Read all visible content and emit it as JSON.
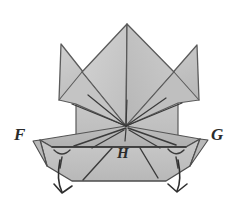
{
  "figure": {
    "kind": "origami-fold-diagram",
    "background_color": "#ffffff",
    "paper_fill_light": "#cfcfcf",
    "paper_fill_mid": "#c2c2c2",
    "paper_fill_dark": "#b2b2b2",
    "paper_fill_darker": "#a6a6a6",
    "outline_color": "#4a4a4a",
    "fold_line_color": "#3a3a3a",
    "arrow_color": "#2e2e2e",
    "label_color": "#2b2b2b"
  },
  "labels": {
    "left_corner": "F",
    "center_point": "H",
    "right_corner": "G"
  },
  "annotations": {
    "convergence_point": "126,126",
    "left_arrow": "fold-arrow-left",
    "right_arrow": "fold-arrow-right"
  }
}
